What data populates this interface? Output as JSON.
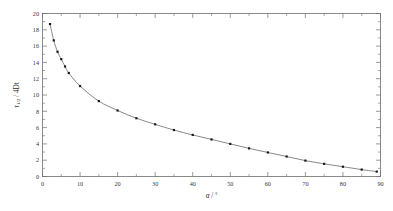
{
  "chart_data": {
    "type": "line",
    "title": "",
    "subtitle": "",
    "xlabel": "α / °",
    "xlabel_symbol": "α",
    "xlabel_unit": "°",
    "ylabel": "τ1/2 / 4Dt",
    "ylabel_symbol": "τ",
    "ylabel_sub": "1/2",
    "ylabel_rest": " / 4Dt",
    "xlim": [
      0,
      90
    ],
    "ylim": [
      0,
      20
    ],
    "x_major_ticks": [
      0,
      10,
      20,
      30,
      40,
      50,
      60,
      70,
      80,
      90
    ],
    "x_major_tick_labels": [
      "0",
      "10",
      "20",
      "30",
      "40",
      "50",
      "60",
      "70",
      "80",
      "90"
    ],
    "x_minor_ticks": [
      5,
      15,
      25,
      35,
      45,
      55,
      65,
      75,
      85
    ],
    "y_major_ticks": [
      0,
      2,
      4,
      6,
      8,
      10,
      12,
      14,
      16,
      18,
      20
    ],
    "y_major_tick_labels": [
      "0",
      "2",
      "4",
      "6",
      "8",
      "10",
      "12",
      "14",
      "16",
      "18",
      "20"
    ],
    "y_minor_ticks": [
      1,
      3,
      5,
      7,
      9,
      11,
      13,
      15,
      17,
      19
    ],
    "grid": false,
    "legend": false,
    "legend_position": "none",
    "marker_style": "square",
    "line_color": "#6a6a6a",
    "marker_color": "#1a1a1a",
    "series": [
      {
        "name": "half-time vs angle",
        "x": [
          2,
          3,
          4,
          5,
          6,
          7,
          10,
          15,
          20,
          25,
          30,
          35,
          40,
          45,
          50,
          55,
          60,
          65,
          70,
          75,
          80,
          85,
          89
        ],
        "values": [
          18.7,
          16.7,
          15.3,
          14.4,
          13.5,
          12.7,
          11.1,
          9.25,
          8.1,
          7.15,
          6.4,
          5.7,
          5.1,
          4.55,
          4.0,
          3.45,
          2.95,
          2.45,
          1.95,
          1.55,
          1.2,
          0.85,
          0.6
        ]
      }
    ]
  },
  "figure": {
    "background_color": "#ffffff",
    "frame_color": "#6e6e6e"
  }
}
